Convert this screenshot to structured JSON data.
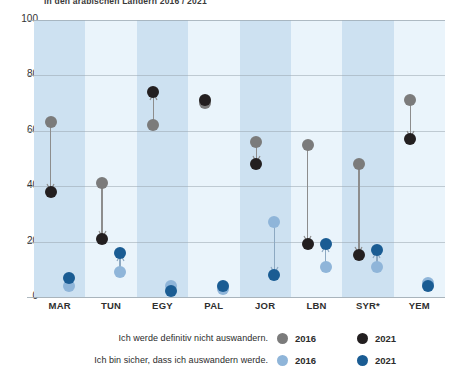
{
  "title": "in den arabischen Ländern 2016 / 2021",
  "chart_data": {
    "type": "scatter",
    "title": "in den arabischen Ländern 2016 / 2021",
    "xlabel": "",
    "ylabel": "",
    "ylim": [
      0,
      100
    ],
    "yticks": [
      0,
      20,
      40,
      60,
      80,
      100
    ],
    "grid": true,
    "legend_position": "bottom",
    "categories": [
      "MAR",
      "TUN",
      "EGY",
      "PAL",
      "JOR",
      "LBN",
      "SYR*",
      "YEM"
    ],
    "series": [
      {
        "name": "Ich werde definitiv nicht auswandern. 2016",
        "key": "stay_2016",
        "color": "#7b7b7b",
        "values": [
          63,
          41,
          62,
          70,
          56,
          55,
          48,
          71
        ]
      },
      {
        "name": "Ich werde definitiv nicht auswandern. 2021",
        "key": "stay_2021",
        "color": "#231f20",
        "values": [
          38,
          21,
          74,
          71,
          48,
          19,
          15,
          57
        ]
      },
      {
        "name": "Ich bin sicher, dass ich auswandern werde. 2016",
        "key": "leave_2016",
        "color": "#8fb5d9",
        "values": [
          4,
          9,
          4,
          3,
          27,
          11,
          11,
          5
        ]
      },
      {
        "name": "Ich bin sicher, dass ich auswandern werde. 2021",
        "key": "leave_2021",
        "color": "#1a5c93",
        "values": [
          7,
          16,
          2,
          4,
          8,
          19,
          17,
          4
        ]
      }
    ]
  },
  "yaxis": {
    "ticks": [
      "0",
      "20",
      "40",
      "60",
      "80",
      "100"
    ]
  },
  "xaxis": {
    "labels": [
      "MAR",
      "TUN",
      "EGY",
      "PAL",
      "JOR",
      "LBN",
      "SYR*",
      "YEM"
    ]
  },
  "legend": {
    "rows": [
      {
        "label": "Ich werde definitiv nicht auswandern.",
        "entries": [
          {
            "year": "2016",
            "color": "#7b7b7b"
          },
          {
            "year": "2021",
            "color": "#231f20"
          }
        ]
      },
      {
        "label": "Ich bin sicher, dass ich auswandern werde.",
        "entries": [
          {
            "year": "2016",
            "color": "#8fb5d9"
          },
          {
            "year": "2021",
            "color": "#1a5c93"
          }
        ]
      }
    ]
  },
  "colors": {
    "band_odd": "#cde1f1",
    "band_even": "#eaf4fb",
    "grid": "#9aa7b0",
    "grey_2016": "#7b7b7b",
    "black_2021": "#231f20",
    "light_blue_2016": "#8fb5d9",
    "dark_blue_2021": "#1a5c93"
  }
}
